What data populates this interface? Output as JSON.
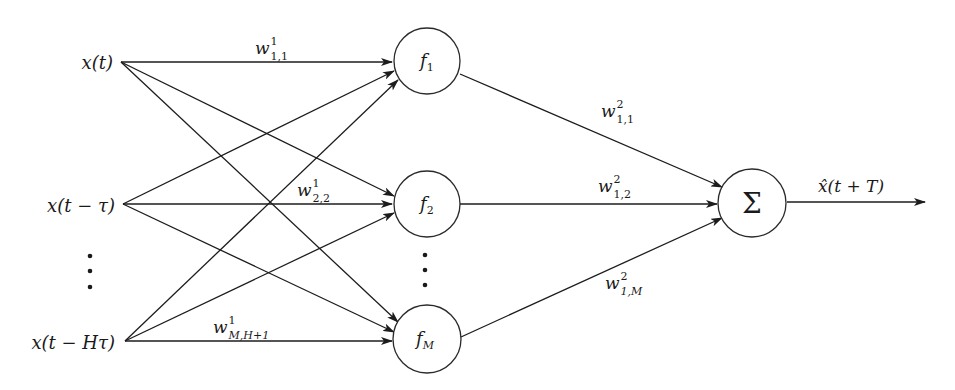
{
  "diagram": {
    "type": "neural-network",
    "inputs": [
      {
        "id": "in0",
        "label": "x(t)"
      },
      {
        "id": "in1",
        "label": "x(t − τ)"
      },
      {
        "id": "in_ellipsis",
        "label": "⋮"
      },
      {
        "id": "inH",
        "label": "x(t − Hτ)"
      }
    ],
    "hidden": [
      {
        "id": "f1",
        "base": "f",
        "sub": "1"
      },
      {
        "id": "f2",
        "base": "f",
        "sub": "2"
      },
      {
        "id": "f_ellipsis",
        "label": "⋮"
      },
      {
        "id": "fM",
        "base": "f",
        "sub": "M"
      }
    ],
    "output_node": {
      "id": "sum",
      "label": "Σ"
    },
    "output_label": {
      "base": "x̂",
      "rest": "(t + T)"
    },
    "weights_layer1": [
      {
        "base": "w",
        "sup": "1",
        "sub": "1,1"
      },
      {
        "base": "w",
        "sup": "1",
        "sub": "2,2"
      },
      {
        "base": "w",
        "sup": "1",
        "sub": "M,H+1"
      }
    ],
    "weights_layer2": [
      {
        "base": "w",
        "sup": "2",
        "sub": "1,1"
      },
      {
        "base": "w",
        "sup": "2",
        "sub": "1,2"
      },
      {
        "base": "w",
        "sup": "2",
        "sub": "1,M"
      }
    ]
  }
}
